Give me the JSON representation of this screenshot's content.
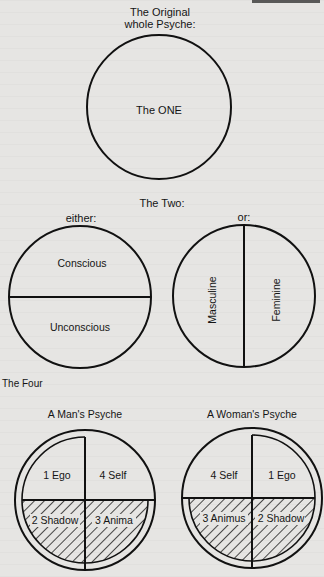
{
  "section_one": {
    "title_line1": "The Original",
    "title_line2": "whole Psyche:",
    "circle_label": "The ONE"
  },
  "section_two": {
    "title": "The Two:",
    "left": {
      "caption": "either:",
      "top_label": "Conscious",
      "bottom_label": "Unconscious"
    },
    "right": {
      "caption": "or:",
      "left_label": "Masculine",
      "right_label": "Feminine"
    }
  },
  "section_four": {
    "title": "The Four",
    "man": {
      "caption": "A Man's Psyche",
      "quadrants": {
        "top_left": "1 Ego",
        "top_right": "4 Self",
        "bottom_left": "2 Shadow",
        "bottom_right": "3 Anima"
      }
    },
    "woman": {
      "caption": "A Woman's Psyche",
      "quadrants": {
        "top_left": "4 Self",
        "top_right": "1 Ego",
        "bottom_left": "3 Animus",
        "bottom_right": "2 Shadow"
      }
    }
  },
  "colors": {
    "background": "#e6e5e3",
    "ink": "#111111"
  }
}
